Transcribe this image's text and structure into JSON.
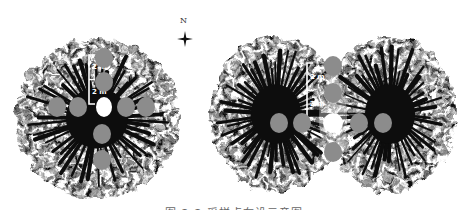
{
  "figure": {
    "north_label": "N",
    "caption": "图 2-2 采样点布设示意图",
    "colors": {
      "canopy": "#0d0d0d",
      "sample_point": "#8c8c8c",
      "trunk_point": "#ffffff",
      "background": "#ffffff"
    },
    "left_panel": {
      "canopy": {
        "cx": 97,
        "cy": 118,
        "rx": 82,
        "ry": 80
      },
      "scale_bar": {
        "x": 89,
        "y1": 55,
        "y2": 104,
        "labels": [
          "2 m",
          "2 m"
        ]
      },
      "trunk": {
        "cx": 104,
        "cy": 107
      },
      "sample_points": [
        {
          "cx": 104,
          "cy": 58
        },
        {
          "cx": 104,
          "cy": 82
        },
        {
          "cx": 57,
          "cy": 107
        },
        {
          "cx": 78,
          "cy": 107
        },
        {
          "cx": 126,
          "cy": 107
        },
        {
          "cx": 146,
          "cy": 107
        },
        {
          "cx": 102,
          "cy": 134
        },
        {
          "cx": 102,
          "cy": 160
        }
      ]
    },
    "right_panel": {
      "canopies": [
        {
          "cx": 276,
          "cy": 114,
          "rx": 66,
          "ry": 78
        },
        {
          "cx": 390,
          "cy": 114,
          "rx": 66,
          "ry": 78
        }
      ],
      "scale_bar": {
        "x": 307,
        "y1": 63,
        "y2": 118,
        "labels": [
          "2 m",
          "2 m"
        ]
      },
      "gap_point": {
        "cx": 333,
        "cy": 123
      },
      "sample_points": [
        {
          "cx": 333,
          "cy": 66
        },
        {
          "cx": 333,
          "cy": 93
        },
        {
          "cx": 279,
          "cy": 123
        },
        {
          "cx": 302,
          "cy": 123
        },
        {
          "cx": 359,
          "cy": 123
        },
        {
          "cx": 383,
          "cy": 123
        },
        {
          "cx": 333,
          "cy": 152
        }
      ]
    }
  }
}
